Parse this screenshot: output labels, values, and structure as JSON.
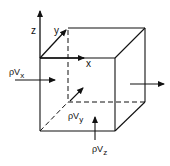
{
  "diagram": {
    "axes": {
      "x": "x",
      "y": "y",
      "z": "z"
    },
    "fluxes": {
      "x": {
        "base": "ρV",
        "sub": "x"
      },
      "y": {
        "base": "ρV",
        "sub": "y"
      },
      "z": {
        "base": "ρV",
        "sub": "z"
      }
    },
    "colors": {
      "ink": "#111111",
      "background": "#ffffff"
    }
  }
}
